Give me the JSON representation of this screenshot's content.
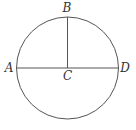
{
  "diagram": {
    "type": "geometry-circle",
    "colors": {
      "stroke": "#555555",
      "label": "#333333",
      "background": "#ffffff"
    },
    "circle": {
      "center_label": "C",
      "cx": 67.5,
      "cy": 68,
      "r": 51
    },
    "segments": [
      {
        "name": "diameter-AD",
        "from": "A",
        "to": "D"
      },
      {
        "name": "radius-CB",
        "from": "C",
        "to": "B"
      }
    ],
    "points": {
      "A": {
        "label": "A",
        "x": 16.5,
        "y": 68
      },
      "B": {
        "label": "B",
        "x": 67.5,
        "y": 17
      },
      "C": {
        "label": "C",
        "x": 67.5,
        "y": 68
      },
      "D": {
        "label": "D",
        "x": 118.5,
        "y": 68
      }
    }
  }
}
